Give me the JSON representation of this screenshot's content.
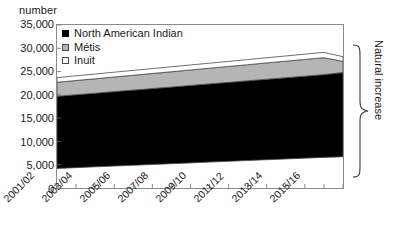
{
  "chart_data": {
    "type": "area",
    "title": "",
    "subtitle": "",
    "ylabel": "number",
    "xlabel": "",
    "ylim": [
      0,
      35000
    ],
    "ytick_values": [
      35000,
      30000,
      25000,
      20000,
      15000,
      10000,
      5000,
      0
    ],
    "ytick_labels": [
      "35,000",
      "30,000",
      "25,000",
      "20,000",
      "15,000",
      "10,000",
      "5,000",
      "0"
    ],
    "grid": false,
    "stacked": true,
    "legend_position": "top-left",
    "x": [
      "2001/02",
      "2002/03",
      "2003/04",
      "2004/05",
      "2005/06",
      "2006/07",
      "2007/08",
      "2008/09",
      "2009/10",
      "2010/11",
      "2011/12",
      "2012/13",
      "2013/14",
      "2014/15",
      "2015/16",
      "2016/17"
    ],
    "xtick_labels": [
      "2001/02",
      "2003/04",
      "2005/06",
      "2007/08",
      "2009/10",
      "2011/12",
      "2013/14",
      "2015/16"
    ],
    "baseline_values": [
      4200,
      4370,
      4540,
      4710,
      4880,
      5050,
      5220,
      5390,
      5560,
      5730,
      5900,
      6070,
      6240,
      6410,
      6570,
      6700
    ],
    "series": [
      {
        "name": "North American Indian",
        "color": "#000000",
        "values": [
          15500,
          15660,
          15820,
          15990,
          16150,
          16310,
          16470,
          16640,
          16800,
          16960,
          17120,
          17290,
          17450,
          17610,
          17780,
          18100
        ],
        "cumulative_top": [
          19700,
          20030,
          20360,
          20700,
          21030,
          21360,
          21690,
          22030,
          22360,
          22690,
          23020,
          23360,
          23690,
          24020,
          24350,
          24800
        ]
      },
      {
        "name": "Métis",
        "color": "#b5b5b5",
        "values": [
          3000,
          3050,
          3090,
          3140,
          3180,
          3230,
          3270,
          3320,
          3360,
          3410,
          3450,
          3500,
          3540,
          3590,
          3630,
          2400
        ],
        "cumulative_top": [
          22700,
          23080,
          23450,
          23840,
          24210,
          24590,
          24960,
          25350,
          25720,
          26100,
          26470,
          26860,
          27230,
          27610,
          27980,
          27200
        ]
      },
      {
        "name": "Inuit",
        "color": "#ffffff",
        "values": [
          1000,
          1010,
          1020,
          1030,
          1040,
          1050,
          1060,
          1070,
          1080,
          1090,
          1100,
          1110,
          1120,
          1130,
          1140,
          1000
        ],
        "cumulative_top": [
          23700,
          24090,
          24470,
          24870,
          25250,
          25640,
          26020,
          26420,
          26800,
          27190,
          27570,
          27970,
          28350,
          28740,
          29120,
          28200
        ]
      }
    ],
    "annotations": [
      {
        "name": "natural-increase",
        "label": "Natural increase",
        "type": "brace",
        "orientation": "vertical-right",
        "spans_from": 6700,
        "spans_to": 28200
      }
    ]
  },
  "legend": {
    "items": [
      {
        "label": "North American Indian",
        "swatch": "black-square-icon"
      },
      {
        "label": "Métis",
        "swatch": "gray-square-icon"
      },
      {
        "label": "Inuit",
        "swatch": "white-square-icon"
      }
    ]
  }
}
